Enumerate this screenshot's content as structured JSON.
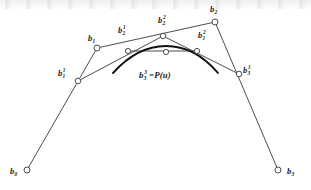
{
  "figure": {
    "background_color": "#ffffff",
    "ink_color": "#3a3a3a",
    "curve_color": "#111111",
    "width": 311,
    "height": 190
  },
  "labels": {
    "b0": {
      "base": "b",
      "sub": "0",
      "sup": "",
      "text": "b0",
      "x": 10,
      "y": 167
    },
    "b1": {
      "base": "b",
      "sub": "1",
      "sup": "",
      "text": "b1",
      "x": 88,
      "y": 34
    },
    "b2": {
      "base": "b",
      "sub": "2",
      "sup": "",
      "text": "b2",
      "x": 210,
      "y": 5
    },
    "b3": {
      "base": "b",
      "sub": "3",
      "sup": "",
      "text": "b3",
      "x": 287,
      "y": 167
    },
    "b1_1": {
      "base": "b",
      "sub": "1",
      "sup": "1",
      "text": "b1^1",
      "x": 58,
      "y": 69
    },
    "b2_1": {
      "base": "b",
      "sub": "2",
      "sup": "1",
      "text": "b2^1",
      "x": 118,
      "y": 26
    },
    "b3_1": {
      "base": "b",
      "sub": "3",
      "sup": "1",
      "text": "b3^1",
      "x": 243,
      "y": 66
    },
    "b2_2": {
      "base": "b",
      "sub": "2",
      "sup": "2",
      "text": "b2^2",
      "x": 158,
      "y": 16
    },
    "b1_2": {
      "base": "b",
      "sub": "1",
      "sup": "2",
      "text": "b1^2",
      "x": 198,
      "y": 31
    }
  },
  "equation": {
    "base": "b",
    "sub": "3",
    "sup": "3",
    "operator": "=",
    "function": "P(u)",
    "full_text": "b3^3 = P(u)",
    "x": 139,
    "y": 71
  },
  "points": {
    "b0": {
      "x": 27,
      "y": 170,
      "marker": "open-circle",
      "r": 3.0
    },
    "b1": {
      "x": 97,
      "y": 48,
      "marker": "open-circle",
      "r": 3.0
    },
    "b2": {
      "x": 215,
      "y": 22,
      "marker": "open-circle",
      "r": 3.0
    },
    "b3": {
      "x": 278,
      "y": 170,
      "marker": "open-circle",
      "r": 3.0
    },
    "b1_1": {
      "x": 78,
      "y": 81,
      "marker": "open-circle",
      "r": 2.8
    },
    "b2_1": {
      "x": 163,
      "y": 36,
      "marker": "open-circle",
      "r": 2.8
    },
    "b3_1": {
      "x": 239,
      "y": 74,
      "marker": "open-circle",
      "r": 2.8
    },
    "b2_2": {
      "x": 128,
      "y": 51,
      "marker": "open-circle",
      "r": 2.6
    },
    "b1_2": {
      "x": 197,
      "y": 51,
      "marker": "open-circle",
      "r": 2.6
    },
    "b3_3": {
      "x": 166,
      "y": 52,
      "marker": "open-circle",
      "r": 2.6
    }
  },
  "polylines": {
    "control_polygon": {
      "name": "control-polygon",
      "points": "27,170 97,48 215,22 278,170"
    },
    "first_level": {
      "name": "first-level-polyline",
      "points": "78,81 163,36 239,74"
    },
    "second_level": {
      "name": "second-level-polyline",
      "points": "128,51 197,51"
    }
  },
  "curve": {
    "name": "bezier-curve",
    "path": "M 113,73 C 131,53 150,46 166,46 C 183,46 201,53 218,73",
    "stroke_width": 1.9
  }
}
